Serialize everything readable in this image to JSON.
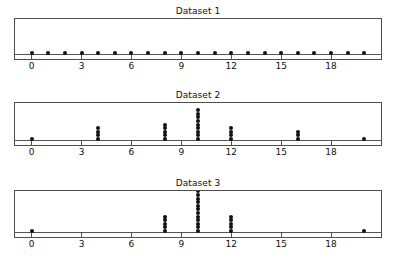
{
  "figure": {
    "width": 400,
    "height": 267,
    "background": "#ffffff",
    "dot_color": "#111111",
    "frame_color": "#4d4d4d",
    "axis_color": "#555555"
  },
  "chart_data": {
    "type": "scatter",
    "subtype": "dot-plot",
    "title": "",
    "xlabel": "",
    "ylabel": "",
    "xlim": [
      -1,
      21
    ],
    "xticks": [
      0,
      3,
      6,
      9,
      12,
      15,
      18
    ],
    "xtick_labels": [
      "0",
      "3",
      "6",
      "9",
      "12",
      "15",
      "18"
    ],
    "grid": false,
    "legend": false,
    "panels": [
      {
        "title": "Dataset 1",
        "x": [
          0,
          1,
          2,
          3,
          4,
          5,
          6,
          7,
          8,
          9,
          10,
          11,
          12,
          13,
          14,
          15,
          16,
          17,
          18,
          19,
          20
        ],
        "counts": [
          1,
          1,
          1,
          1,
          1,
          1,
          1,
          1,
          1,
          1,
          1,
          1,
          1,
          1,
          1,
          1,
          1,
          1,
          1,
          1,
          1
        ],
        "n": 21,
        "max_stack": 1
      },
      {
        "title": "Dataset 2",
        "x": [
          0,
          4,
          8,
          10,
          12,
          16,
          20
        ],
        "counts": [
          1,
          4,
          5,
          9,
          4,
          3,
          1
        ],
        "n": 27,
        "max_stack": 9
      },
      {
        "title": "Dataset 3",
        "x": [
          0,
          8,
          10,
          12,
          20
        ],
        "counts": [
          1,
          5,
          12,
          5,
          1
        ],
        "n": 24,
        "max_stack": 12
      }
    ]
  }
}
